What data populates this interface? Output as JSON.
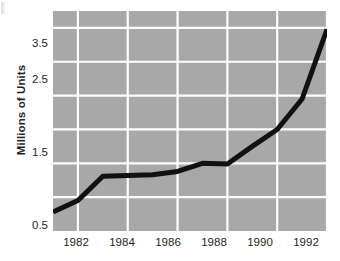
{
  "chart_data": {
    "type": "line",
    "title": "",
    "xlabel": "",
    "ylabel": "Millions of Units",
    "xlim": [
      1981,
      1992
    ],
    "ylim": [
      0.5,
      3.75
    ],
    "grid": true,
    "legend": false,
    "line_color": "#111111",
    "plot_background": "#a8a8a8",
    "gridline_color": "#ffffff",
    "x_tick_labels": [
      "1982",
      "1984",
      "1986",
      "1988",
      "1990",
      "1992"
    ],
    "x_tick_values": [
      1982,
      1984,
      1986,
      1988,
      1990,
      1992
    ],
    "y_tick_labels": [
      "0.5",
      "1.5",
      "2.5",
      "3.5"
    ],
    "y_tick_values": [
      0.5,
      1.5,
      2.5,
      3.5
    ],
    "y_gridline_values": [
      1.0,
      1.5,
      2.0,
      2.5,
      3.0,
      3.5
    ],
    "x_gridline_values": [
      1982,
      1984,
      1986,
      1988,
      1990,
      1992
    ],
    "x": [
      1981,
      1982,
      1983,
      1984,
      1985,
      1986,
      1987,
      1988,
      1989,
      1990,
      1991,
      1992
    ],
    "values": [
      0.78,
      0.95,
      1.31,
      1.32,
      1.33,
      1.38,
      1.5,
      1.49,
      1.75,
      2.0,
      2.45,
      3.48
    ],
    "series": [
      {
        "name": "Units shipped",
        "values": [
          0.78,
          0.95,
          1.31,
          1.32,
          1.33,
          1.38,
          1.5,
          1.49,
          1.75,
          2.0,
          2.45,
          3.48
        ]
      }
    ]
  }
}
